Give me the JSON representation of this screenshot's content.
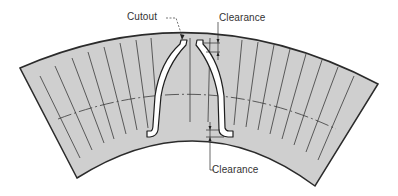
{
  "figure": {
    "type": "technical-diagram",
    "colors": {
      "fill": "#cfcfcf",
      "outline": "#2b2b2b",
      "line": "#3a3a3a",
      "slot": "#ffffff",
      "background": "#ffffff",
      "text": "#333333"
    }
  },
  "labels": {
    "cutout": "Cutout",
    "clearance_top": "Clearance",
    "clearance_bottom": "Clearance"
  }
}
